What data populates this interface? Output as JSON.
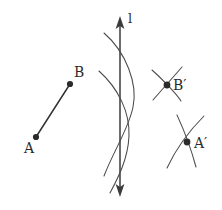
{
  "figure": {
    "background_color": "#ffffff",
    "stroke_color": "#3b3b3b",
    "point_color": "#2b2b2b",
    "width": 222,
    "height": 210,
    "line_label": "l",
    "labels": {
      "a": "A",
      "b": "B",
      "a_prime": "A′",
      "b_prime": "B′"
    },
    "points": [
      {
        "name": "A",
        "label": "A",
        "x": 36,
        "y": 137
      },
      {
        "name": "B",
        "label": "B",
        "x": 70,
        "y": 84
      },
      {
        "name": "B'",
        "label": "B′",
        "x": 167,
        "y": 85
      },
      {
        "name": "A'",
        "label": "A′",
        "x": 187,
        "y": 142
      }
    ],
    "mirror_line": {
      "label": "l",
      "x": 120,
      "y_top": 18,
      "y_bottom": 195,
      "arrows": "double"
    },
    "construction": {
      "big_arcs_count": 2,
      "crossing_point": {
        "x": 120,
        "y": 122
      },
      "b_prime_arcs": 2,
      "a_prime_arcs": 2
    }
  }
}
